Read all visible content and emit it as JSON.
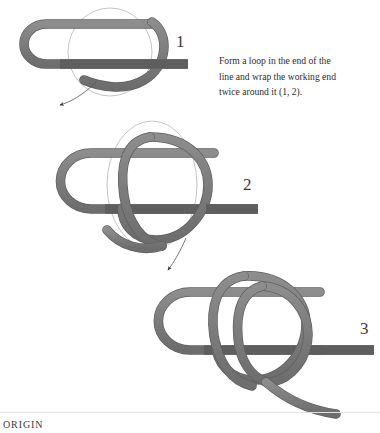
{
  "page": {
    "background_color": "#ffffff",
    "width": 380,
    "height": 433
  },
  "illustration": {
    "subject": "knot-tying-sequence",
    "rope_color": "#7d7d7d",
    "rope_outline_color": "#5e5e5e",
    "rope_highlight_color": "#9a9a9a",
    "ghost_outline_color": "#b9b9b9",
    "arrow_color": "#4a4a4a"
  },
  "steps": [
    {
      "id": "step-1",
      "number": "1"
    },
    {
      "id": "step-2",
      "number": "2"
    },
    {
      "id": "step-3",
      "number": "3"
    }
  ],
  "instruction": {
    "line1": "Form a loop in the end of the",
    "line2": "line and wrap the working end",
    "line3": "twice around it (1, 2)."
  },
  "footer": {
    "origin_label": "ORIGIN",
    "rule_color": "#e2e2e2"
  }
}
